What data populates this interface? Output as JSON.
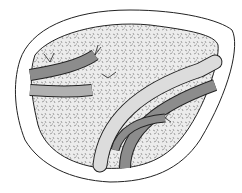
{
  "illustration": {
    "subject": "cross-section of organ parenchyma with branching vessels",
    "colors": {
      "background": "#ffffff",
      "outline": "#222222",
      "parenchyma": "#e8e8e8",
      "speckle": "#9a9a9a",
      "vessel_dark": "#8c8c8c",
      "vessel_light": "#dcdcdc"
    }
  }
}
